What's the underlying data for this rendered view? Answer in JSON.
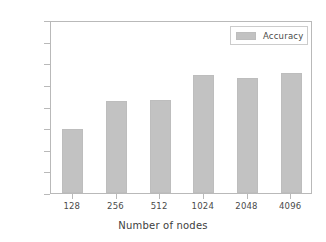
{
  "chart_data": {
    "type": "bar",
    "title": "",
    "subtitle": "",
    "xlabel": "Number of nodes",
    "ylabel": "",
    "categories": [
      "128",
      "256",
      "512",
      "1024",
      "2048",
      "4096"
    ],
    "values": [
      0.9774,
      0.9806,
      0.9808,
      0.9836,
      0.9833,
      0.9839
    ],
    "series": [
      {
        "name": "Accuracy",
        "values": [
          0.9774,
          0.9806,
          0.9808,
          0.9836,
          0.9833,
          0.9839
        ]
      }
    ],
    "ylim": [
      0.97,
      0.99
    ],
    "yticks": [
      0.97,
      0.9725,
      0.975,
      0.9775,
      0.98,
      0.9825,
      0.985,
      0.9875,
      0.99
    ],
    "ytick_labels": [
      "0.9700",
      "0.9725",
      "0.9750",
      "0.9775",
      "0.9800",
      "0.9825",
      "0.9850",
      "0.9875",
      "0.9900"
    ],
    "xtick_labels": [
      "128",
      "256",
      "512",
      "1024",
      "2048",
      "4096"
    ],
    "grid": false,
    "legend": {
      "position": "top-right",
      "entries": [
        {
          "label": "Accuracy",
          "color": "#c2c2c2"
        }
      ]
    },
    "colors": {
      "bar": "#c2c2c2",
      "bar_edge": "#bdbdbd",
      "axis": "#b9b9b9",
      "text": "#4a4a4a",
      "background": "#ffffff"
    }
  }
}
